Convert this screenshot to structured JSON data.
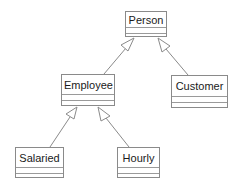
{
  "diagram": {
    "type": "uml-class-diagram",
    "classes": [
      {
        "id": "person",
        "name": "Person",
        "x": 125,
        "y": 11,
        "w": 42,
        "h": 26
      },
      {
        "id": "employee",
        "name": "Employee",
        "x": 61,
        "y": 74,
        "w": 54,
        "h": 32
      },
      {
        "id": "customer",
        "name": "Customer",
        "x": 171,
        "y": 75,
        "w": 57,
        "h": 33
      },
      {
        "id": "salaried",
        "name": "Salaried",
        "x": 15,
        "y": 147,
        "w": 49,
        "h": 31
      },
      {
        "id": "hourly",
        "name": "Hourly",
        "x": 117,
        "y": 147,
        "w": 43,
        "h": 31
      }
    ],
    "relationships": [
      {
        "type": "generalization",
        "from": "Employee",
        "to": "Person"
      },
      {
        "type": "generalization",
        "from": "Customer",
        "to": "Person"
      },
      {
        "type": "generalization",
        "from": "Salaried",
        "to": "Employee"
      },
      {
        "type": "generalization",
        "from": "Hourly",
        "to": "Employee"
      }
    ],
    "colors": {
      "line": "#8a8a8a",
      "text": "#1a1a1a",
      "background": "#ffffff"
    }
  }
}
